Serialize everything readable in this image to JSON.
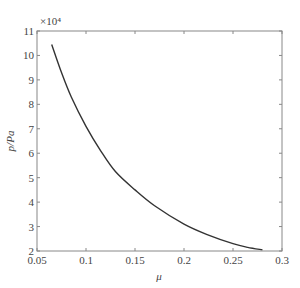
{
  "chart_data": {
    "type": "line",
    "title": "",
    "xlabel": "μ",
    "ylabel": "p/Pa",
    "y_multiplier_label": "×10⁴",
    "xlim": [
      0.05,
      0.3
    ],
    "ylim": [
      2,
      11
    ],
    "xticks": [
      0.05,
      0.1,
      0.15,
      0.2,
      0.25,
      0.3
    ],
    "xtick_labels": [
      "0.05",
      "0.1",
      "0.15",
      "0.2",
      "0.25",
      "0.3"
    ],
    "yticks": [
      2,
      3,
      4,
      5,
      6,
      7,
      8,
      9,
      10,
      11
    ],
    "ytick_labels": [
      "2",
      "3",
      "4",
      "5",
      "6",
      "7",
      "8",
      "9",
      "10",
      "11"
    ],
    "grid": false,
    "legend": null,
    "series": [
      {
        "name": "p",
        "color": "#333333",
        "x": [
          0.065,
          0.075,
          0.085,
          0.1,
          0.115,
          0.13,
          0.15,
          0.17,
          0.2,
          0.225,
          0.25,
          0.265,
          0.28
        ],
        "y": [
          10.45,
          9.3,
          8.3,
          7.1,
          6.1,
          5.25,
          4.5,
          3.85,
          3.1,
          2.65,
          2.3,
          2.15,
          2.05
        ]
      }
    ]
  }
}
